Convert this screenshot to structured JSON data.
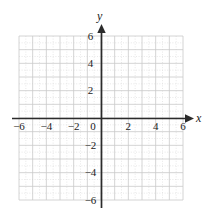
{
  "figure": {
    "kind": "cartesian-coordinate-grid",
    "width": 206,
    "height": 220,
    "background_color": "#ffffff"
  },
  "axes": {
    "x_axis_label": "x",
    "y_axis_label": "y",
    "axis_color": "#2b2b2b",
    "origin_label": "0",
    "arrowheads": [
      "positive-x",
      "positive-y"
    ]
  },
  "grid": {
    "minor_step": 0.5,
    "major_step": 1,
    "minor_color": "#d9d9d9",
    "major_color": "#c4c4c4",
    "grid_visible": true
  },
  "chart_data": {
    "type": "scatter",
    "title": "",
    "subtitle": "",
    "xlabel": "x",
    "ylabel": "y",
    "xlim": [
      -6,
      6
    ],
    "ylim": [
      -6,
      6
    ],
    "xticks": [
      -6,
      -4,
      -2,
      0,
      2,
      4,
      6
    ],
    "yticks": [
      -6,
      -4,
      -2,
      2,
      4,
      6
    ],
    "xticklabels": [
      "−6",
      "−4",
      "−2",
      "0",
      "2",
      "4",
      "6"
    ],
    "yticklabels": [
      "−6",
      "−4",
      "−2",
      "4",
      "6",
      "2"
    ],
    "x": [],
    "y": [],
    "series": [],
    "grid": true,
    "legend": null,
    "annotations": []
  },
  "ticks": {
    "x": [
      {
        "value": -6,
        "label": "−6",
        "px": 19
      },
      {
        "value": -4,
        "label": "−4",
        "px": 46.3
      },
      {
        "value": -2,
        "label": "−2",
        "px": 73.7
      },
      {
        "value": 0,
        "label": "0",
        "px": 101
      },
      {
        "value": 2,
        "label": "2",
        "px": 128.3
      },
      {
        "value": 4,
        "label": "4",
        "px": 155.7
      },
      {
        "value": 6,
        "label": "6",
        "px": 183
      }
    ],
    "y": [
      {
        "value": 6,
        "label": "6",
        "px": 36
      },
      {
        "value": 4,
        "label": "4",
        "px": 63.3
      },
      {
        "value": 2,
        "label": "2",
        "px": 90.7
      },
      {
        "value": -2,
        "label": "−2",
        "px": 145.3
      },
      {
        "value": -4,
        "label": "−4",
        "px": 172.7
      },
      {
        "value": -6,
        "label": "−6",
        "px": 200
      }
    ]
  }
}
